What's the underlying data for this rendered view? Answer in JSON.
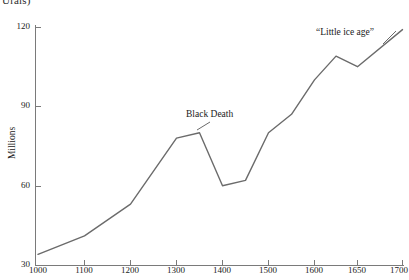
{
  "caption_fragment": "Urals)",
  "chart_data": {
    "type": "line",
    "title": "",
    "subtitle": "",
    "xlabel": "",
    "ylabel": "Millions",
    "ylim": [
      30,
      120
    ],
    "yticks": [
      30,
      60,
      90,
      120
    ],
    "ytick_labels": [
      "30",
      "60",
      "90",
      "120"
    ],
    "xticks": [
      1000,
      1100,
      1200,
      1300,
      1400,
      1500,
      1600,
      1650,
      1700
    ],
    "xtick_labels": [
      "1000",
      "1100",
      "1200",
      "1300",
      "1400",
      "1500",
      "1600",
      "1650",
      "1700"
    ],
    "x_axis_scale": "non-linear (equal spacing per labelled tick)",
    "grid": false,
    "legend": false,
    "line_color": "#6b6b6b",
    "series": [
      {
        "name": "European population",
        "x": [
          1000,
          1100,
          1200,
          1300,
          1350,
          1400,
          1450,
          1500,
          1550,
          1600,
          1625,
          1650,
          1700
        ],
        "values": [
          34,
          41,
          53,
          78,
          80,
          60,
          62,
          80,
          87,
          100,
          109,
          105,
          119
        ]
      }
    ],
    "annotations": [
      {
        "label": "Black Death",
        "x": 1375,
        "y": 84
      },
      {
        "label": "“Little ice age”",
        "x": 1640,
        "y": 116
      }
    ]
  }
}
